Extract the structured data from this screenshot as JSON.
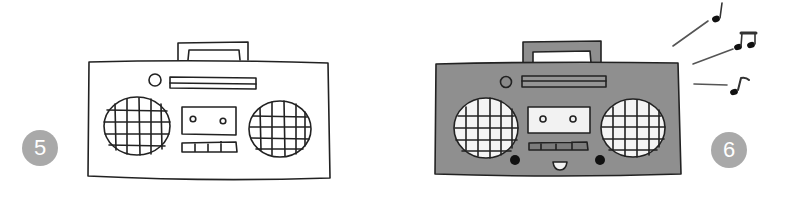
{
  "illustration": {
    "title": "How to draw a boombox",
    "steps": [
      {
        "number": "5",
        "description": "Boombox outline with speakers, cassette deck and buttons"
      },
      {
        "number": "6",
        "description": "Colored boombox with face and music notes"
      }
    ],
    "colors": {
      "ink": "#222222",
      "body_fill": "#8f8f8f",
      "badge": "#a9a9a9",
      "background": "#ffffff"
    },
    "icons": [
      "boombox-outline",
      "boombox-colored",
      "music-note-icon",
      "beamed-notes-icon",
      "eighth-note-icon"
    ]
  }
}
